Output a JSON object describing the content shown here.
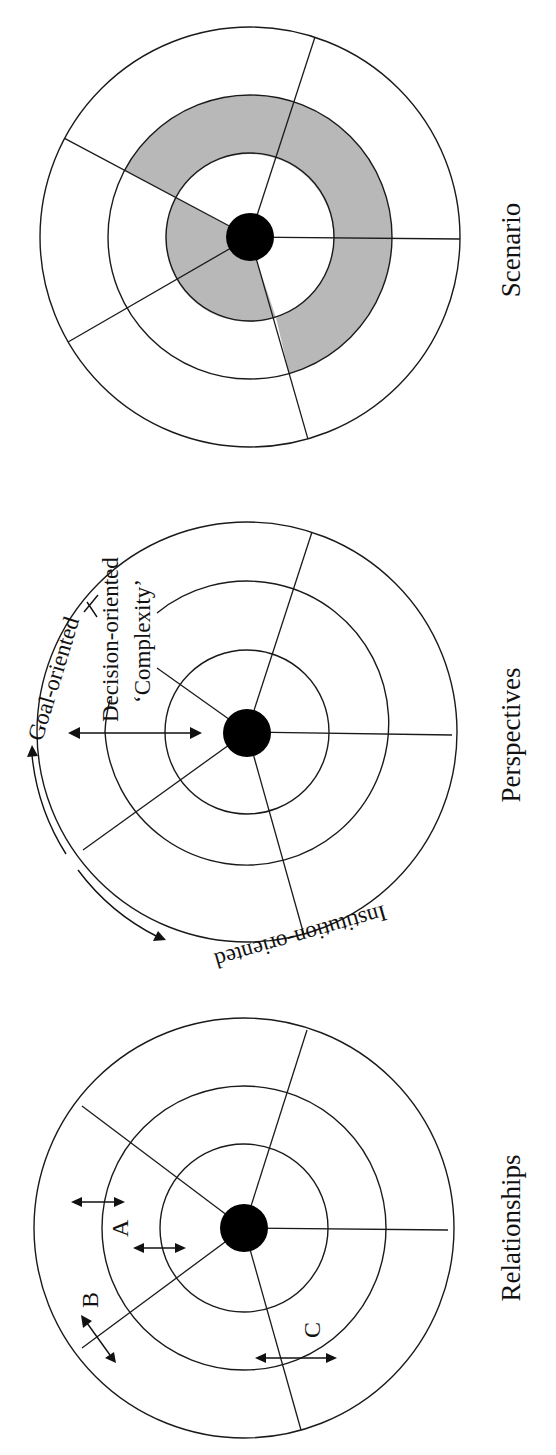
{
  "figures": [
    {
      "id": "scenario",
      "caption": "Scenario",
      "center": [
        250,
        237
      ],
      "radii": {
        "hub": 24,
        "inner": 84,
        "middle": 142,
        "outer": 210
      },
      "spoke_angles_deg": [
        -72,
        -152,
        150,
        74,
        1
      ],
      "shaded": "middle ring band and inner band on left",
      "shade_color": "#b8b8b8"
    },
    {
      "id": "perspectives",
      "caption": "Perspectives",
      "center": [
        247,
        732
      ],
      "radii": {
        "hub": 24,
        "inner": 82,
        "middle": 142,
        "outer": 210
      },
      "spoke_angles_deg": [
        -72,
        -150,
        150,
        76,
        0
      ],
      "labels": {
        "goal": "Goal-oriented",
        "decision": "Decision-oriented",
        "complexity": "‘Complexity’",
        "institution": "Institution-oriented"
      }
    },
    {
      "id": "relationships",
      "caption": "Relationships",
      "center": [
        244,
        1228
      ],
      "radii": {
        "hub": 24,
        "inner": 84,
        "middle": 142,
        "outer": 210
      },
      "spoke_angles_deg": [
        -72,
        -150,
        150,
        76,
        0
      ],
      "labels": {
        "a": "A",
        "b": "B",
        "c": "C"
      }
    }
  ],
  "colors": {
    "ink": "#111111",
    "shade": "#b8b8b8",
    "background": "#ffffff"
  }
}
